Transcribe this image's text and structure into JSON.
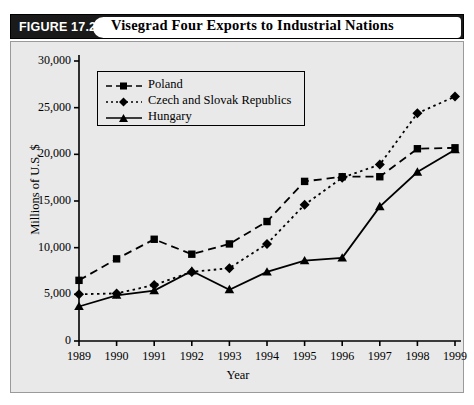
{
  "header": {
    "figure_tag": "FIGURE 17.2",
    "title": "Visegrad Four Exports to Industrial Nations"
  },
  "chart_data": {
    "type": "line",
    "title": "Visegrad Four Exports to Industrial Nations",
    "xlabel": "Year",
    "ylabel": "Millions of U.S. $",
    "categories": [
      "1989",
      "1990",
      "1991",
      "1992",
      "1993",
      "1994",
      "1995",
      "1996",
      "1997",
      "1998",
      "1999"
    ],
    "ylim": [
      0,
      30000
    ],
    "yticks": [
      "0",
      "5,000",
      "10,000",
      "15,000",
      "20,000",
      "25,000",
      "30,000"
    ],
    "ytick_values": [
      0,
      5000,
      10000,
      15000,
      20000,
      25000,
      30000
    ],
    "grid": false,
    "legend_position": "top-left-inside",
    "series": [
      {
        "name": "Poland",
        "marker": "square",
        "line_style": "dashed",
        "color": "#000000",
        "values": [
          6500,
          8800,
          10900,
          9300,
          10400,
          12800,
          17100,
          17600,
          17600,
          20600,
          20700
        ]
      },
      {
        "name": "Czech and Slovak Republics",
        "marker": "diamond",
        "line_style": "dotted",
        "color": "#000000",
        "values": [
          5000,
          5100,
          6000,
          7400,
          7800,
          10400,
          14600,
          17500,
          18900,
          24400,
          26200
        ]
      },
      {
        "name": "Hungary",
        "marker": "triangle",
        "line_style": "solid",
        "color": "#000000",
        "values": [
          3700,
          4900,
          5400,
          7500,
          5500,
          7400,
          8600,
          8900,
          14400,
          18100,
          20500
        ]
      }
    ]
  }
}
